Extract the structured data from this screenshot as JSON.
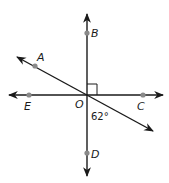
{
  "diagram": {
    "title": "",
    "points": {
      "A": {
        "label": "A"
      },
      "B": {
        "label": "B"
      },
      "C": {
        "label": "C"
      },
      "D": {
        "label": "D"
      },
      "E": {
        "label": "E"
      },
      "O": {
        "label": "O"
      }
    },
    "angle_label": "62°",
    "right_angle_marker": "between ray OB and ray OC",
    "lines": [
      {
        "name": "line BD",
        "orientation": "vertical"
      },
      {
        "name": "line EC",
        "orientation": "horizontal"
      },
      {
        "name": "line through A and O",
        "orientation": "diagonal"
      }
    ],
    "colors": {
      "line": "#1a1a1a",
      "point": "#8a8a8a",
      "background": "#ffffff"
    }
  }
}
